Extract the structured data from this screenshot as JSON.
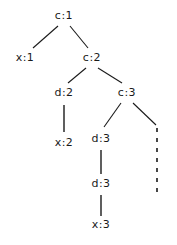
{
  "diagram": {
    "type": "tree",
    "background_color": "#ffffff",
    "stroke_color": "#1a1a1a",
    "text_color": "#1a1a1a",
    "width": 177,
    "height": 245,
    "nodes": [
      {
        "id": "n0",
        "label": "c:1",
        "symbol": "c",
        "index": "1",
        "x": 64,
        "y": 16
      },
      {
        "id": "n1",
        "label": "x:1",
        "symbol": "x",
        "index": "1",
        "x": 25,
        "y": 58
      },
      {
        "id": "n2",
        "label": "c:2",
        "symbol": "c",
        "index": "2",
        "x": 92,
        "y": 58
      },
      {
        "id": "n3",
        "label": "d:2",
        "symbol": "d",
        "index": "2",
        "x": 64,
        "y": 93
      },
      {
        "id": "n4",
        "label": "c:3",
        "symbol": "c",
        "index": "3",
        "x": 127,
        "y": 93
      },
      {
        "id": "n5",
        "label": "x:2",
        "symbol": "x",
        "index": "2",
        "x": 64,
        "y": 143
      },
      {
        "id": "n6",
        "label": "d:3",
        "symbol": "d",
        "index": "3",
        "x": 101,
        "y": 139
      },
      {
        "id": "n7",
        "label": "d:3",
        "symbol": "d",
        "index": "3",
        "x": 101,
        "y": 184
      },
      {
        "id": "n8",
        "label": "x:3",
        "symbol": "x",
        "index": "3",
        "x": 101,
        "y": 225
      }
    ],
    "edges": [
      {
        "id": "e0",
        "from": "n0",
        "to": "n1",
        "style": "solid",
        "kind": "diagonal",
        "x1": 58,
        "y1": 26,
        "x2": 33,
        "y2": 48
      },
      {
        "id": "e1",
        "from": "n0",
        "to": "n2",
        "style": "solid",
        "kind": "diagonal",
        "x1": 70,
        "y1": 26,
        "x2": 88,
        "y2": 48
      },
      {
        "id": "e2",
        "from": "n2",
        "to": "n3",
        "style": "solid",
        "kind": "diagonal",
        "x1": 86,
        "y1": 68,
        "x2": 68,
        "y2": 83
      },
      {
        "id": "e3",
        "from": "n2",
        "to": "n4",
        "style": "solid",
        "kind": "diagonal",
        "x1": 98,
        "y1": 68,
        "x2": 122,
        "y2": 83
      },
      {
        "id": "e4",
        "from": "n3",
        "to": "n5",
        "style": "solid",
        "kind": "vertical",
        "x1": 64,
        "y1": 105,
        "x2": 64,
        "y2": 132
      },
      {
        "id": "e5",
        "from": "n4",
        "to": "n6",
        "style": "solid",
        "kind": "diagonal",
        "x1": 121,
        "y1": 103,
        "x2": 104,
        "y2": 127
      },
      {
        "id": "e6",
        "from": "n4",
        "to": "elided",
        "style": "solid",
        "kind": "diagonal",
        "x1": 133,
        "y1": 103,
        "x2": 156,
        "y2": 125
      },
      {
        "id": "e7",
        "from": "n6",
        "to": "n7",
        "style": "solid",
        "kind": "vertical",
        "x1": 101,
        "y1": 150,
        "x2": 101,
        "y2": 174
      },
      {
        "id": "e8",
        "from": "n7",
        "to": "n8",
        "style": "solid",
        "kind": "vertical",
        "x1": 101,
        "y1": 195,
        "x2": 101,
        "y2": 216
      },
      {
        "id": "e9",
        "from": "elided",
        "to": "continuation",
        "style": "dashed",
        "kind": "vertical",
        "x1": 157,
        "y1": 128,
        "x2": 157,
        "y2": 192
      }
    ]
  }
}
